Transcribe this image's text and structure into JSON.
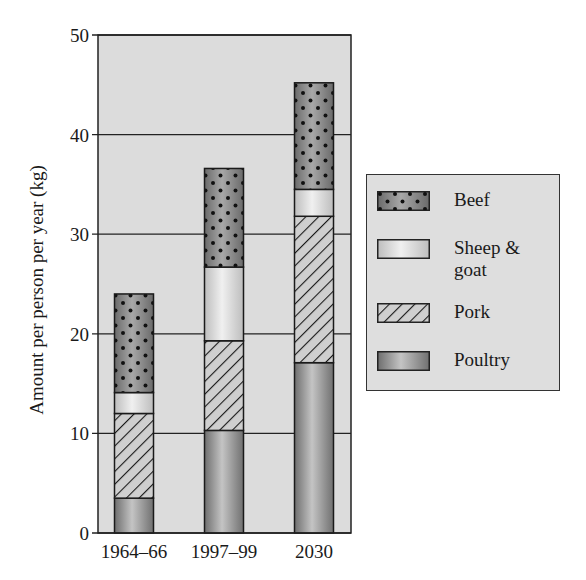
{
  "chart_data": {
    "type": "bar",
    "stacked": true,
    "title": "",
    "xlabel": "",
    "ylabel": "Amount per person per year (kg)",
    "ylim": [
      0,
      50
    ],
    "yticks": [
      0,
      10,
      20,
      30,
      40,
      50
    ],
    "grid": true,
    "legend_position": "right",
    "categories": [
      "1964–66",
      "1997–99",
      "2030"
    ],
    "series": [
      {
        "name": "Poultry",
        "values": [
          3.5,
          10.3,
          17.1
        ]
      },
      {
        "name": "Pork",
        "values": [
          8.5,
          9.0,
          14.7
        ]
      },
      {
        "name": "Sheep & goat",
        "values": [
          2.1,
          7.4,
          2.7
        ]
      },
      {
        "name": "Beef",
        "values": [
          9.9,
          9.9,
          10.7
        ]
      }
    ],
    "totals": [
      24.0,
      36.6,
      45.2
    ]
  },
  "legend": {
    "items": [
      {
        "label_line1": "Beef",
        "label_line2": ""
      },
      {
        "label_line1": "Sheep &",
        "label_line2": "goat"
      },
      {
        "label_line1": "Pork",
        "label_line2": ""
      },
      {
        "label_line1": "Poultry",
        "label_line2": ""
      }
    ]
  },
  "colors": {
    "plot_bg": "#dcdcdc",
    "beef": "#8a8a8a",
    "sheep_goat": "#e4e4e4",
    "pork": "#c8c8c8",
    "poultry": "#a8a8a8"
  }
}
